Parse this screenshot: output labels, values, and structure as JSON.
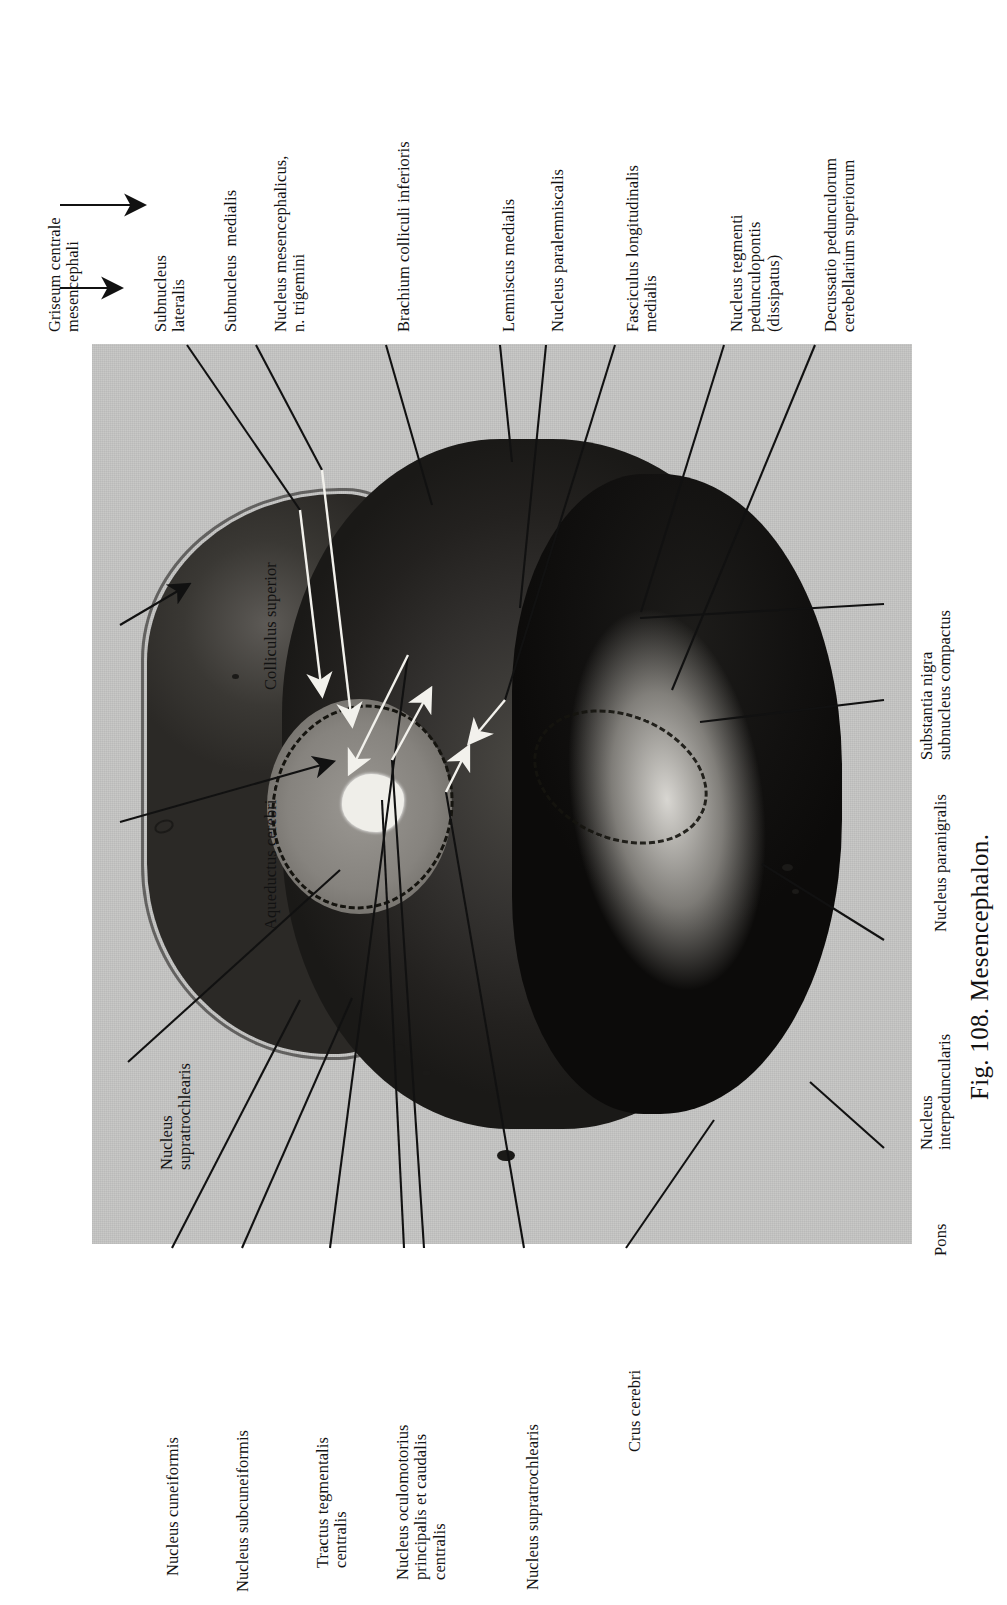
{
  "figure": {
    "caption": "Fig. 108. Mesencephalon.",
    "plate_background": "#c9c9c7",
    "ink_color": "#121212"
  },
  "labels": {
    "top": [
      {
        "id": "griseum-centrale-mesencephali",
        "text": "Griseum centrale\nmesencephali",
        "has_arrow": true
      },
      {
        "id": "subnucleus-lateralis",
        "text": "Subnucleus\nlateralis",
        "has_arrow": true
      },
      {
        "id": "subnucleus-medialis",
        "text": "Subnucleus  medialis",
        "has_arrow": false
      },
      {
        "id": "nucleus-mesencephalicus-n-trigemini",
        "text": "Nucleus mesencephalicus,\nn. trigemini",
        "has_arrow": false
      },
      {
        "id": "brachium-colliculi-inferioris",
        "text": "Brachium colliculi inferioris",
        "has_arrow": false
      },
      {
        "id": "lemniscus-medialis",
        "text": "Lemniscus medialis",
        "has_arrow": false
      },
      {
        "id": "nucleus-paralemniscalis",
        "text": "Nucleus paralemniscalis",
        "has_arrow": false
      },
      {
        "id": "fasciculus-longitudinalis-medialis",
        "text": "Fasciculus longitudinalis\nmedialis",
        "has_arrow": false
      },
      {
        "id": "nucleus-tegmenti-pedunculopontis",
        "text": "Nucleus tegmenti\npedunculopontis\n(dissipatus)",
        "has_arrow": false
      },
      {
        "id": "decussatio-pedunculorum-cerebellarium-superiorum",
        "text": "Decussatio pedunculorum\ncerebellarium superiorum",
        "has_arrow": false
      }
    ],
    "left": [
      {
        "id": "colliculus-superior",
        "text": "Colliculus superior"
      },
      {
        "id": "aqueductus-cerebri",
        "text": "Aqueductus cerebri"
      },
      {
        "id": "nucleus-supratrochlearis-left",
        "text": "Nucleus\nsupratrochlearis"
      }
    ],
    "bottom": [
      {
        "id": "nucleus-cuneiformis",
        "text": "Nucleus cuneiformis"
      },
      {
        "id": "nucleus-subcuneiformis",
        "text": "Nucleus subcuneiformis"
      },
      {
        "id": "tractus-tegmentalis-centralis",
        "text": "Tractus tegmentalis\ncentralis"
      },
      {
        "id": "nucleus-oculomotorius-principalis-et-caudalis-centralis",
        "text": "Nucleus oculomotorius\nprincipalis et caudalis\ncentralis"
      },
      {
        "id": "nucleus-supratrochlearis-bottom",
        "text": "Nucleus supratrochlearis"
      },
      {
        "id": "crus-cerebri",
        "text": "Crus cerebri"
      }
    ],
    "right": [
      {
        "id": "substantia-nigra-subnucleus-compactus",
        "text": "Substantia nigra\nsubnucleus compactus"
      },
      {
        "id": "nucleus-paranigralis",
        "text": "Nucleus paranigralis"
      },
      {
        "id": "nucleus-interpeduncularis",
        "text": "Nucleus\ninterpeduncularis"
      },
      {
        "id": "pons",
        "text": "Pons"
      }
    ]
  }
}
